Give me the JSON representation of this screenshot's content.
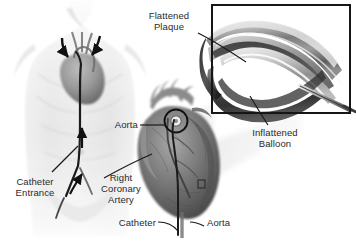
{
  "figure": {
    "background_color": "#ffffff",
    "width": 356,
    "height": 249,
    "style": "grayscale medical illustration"
  },
  "labels": {
    "flattened_plaque": "Flattened\nPlaque",
    "flattened_plaque_line1": "Flattened",
    "flattened_plaque_line2": "Plaque",
    "inflattened_balloon_line1": "Inflattened",
    "inflattened_balloon_line2": "Balloon",
    "catheter_entrance_line1": "Catheter",
    "catheter_entrance_line2": "Entrance",
    "aorta_upper": "Aorta",
    "right_coronary_artery_line1": "Right",
    "right_coronary_artery_line2": "Coronary",
    "right_coronary_artery_line3": "Artery",
    "catheter": "Catheter",
    "aorta_lower": "Aorta"
  },
  "panels": {
    "torso": {
      "name": "Torso with catheter path",
      "description": "Anterior view of human torso showing catheter advanced from femoral artery entrance up the aorta to the heart"
    },
    "heart": {
      "name": "Heart detail",
      "description": "Enlarged heart showing aorta, right coronary artery and catheter, with circled callout at coronary ostium"
    },
    "inset": {
      "name": "Balloon inset",
      "description": "Framed magnified cutaway of artery with inflated balloon compressing plaque",
      "frame_color": "#1a1a1a"
    }
  },
  "colors": {
    "text": "#2b2b2b",
    "leader_line": "#1a1a1a",
    "frame": "#161616",
    "skin_light": "#efefef",
    "skin_mid": "#dcdcdc",
    "heart_dark": "#5d5d5d",
    "heart_mid": "#8a8a8a",
    "vessel_dark": "#3c3c3c",
    "artery_wall": "#6f6f6f",
    "balloon_light": "#d6d6d6",
    "cone": "#f2f2f2"
  },
  "annotations": {
    "arrow_left_curved": "curved arrow over aortic arch (left)",
    "arrow_right_curved": "curved arrow over aortic arch (right)",
    "arrow_up_aorta": "upward arrow along descending aorta",
    "arrow_up_femoral": "upward arrow at femoral bifurcation"
  }
}
